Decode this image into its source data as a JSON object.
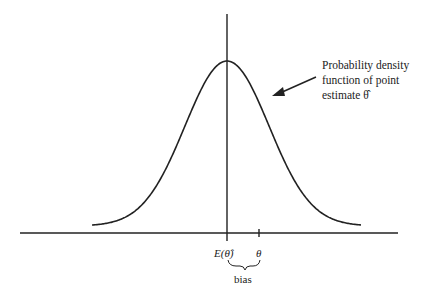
{
  "diagram": {
    "annotation": {
      "lines": [
        "Probability density",
        "function of point",
        "estimate θ̂"
      ]
    },
    "axis_labels": {
      "expected_value": "E(θ̂)",
      "true_parameter": "θ",
      "brace_label": "bias"
    },
    "colors": {
      "stroke": "#222222",
      "background": "#ffffff"
    },
    "curve": {
      "center_x": 227,
      "peak_y": 61,
      "baseline_y": 226,
      "sigma_px": 42,
      "x_start": 92,
      "x_end": 361
    }
  }
}
